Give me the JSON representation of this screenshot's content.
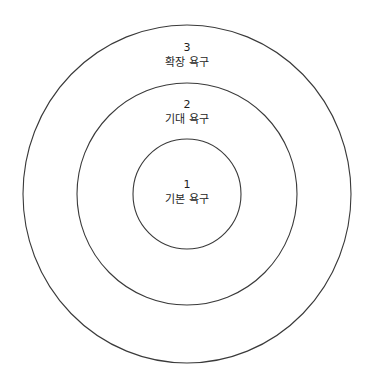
{
  "diagram": {
    "type": "concentric-circles",
    "stroke_color": "#3a3a3a",
    "background": "#ffffff",
    "center": {
      "x": 187,
      "y": 194
    },
    "rings": [
      {
        "level": "1",
        "label": "기본 욕구",
        "rx": 54,
        "ry": 55
      },
      {
        "level": "2",
        "label": "기대 욕구",
        "rx": 110,
        "ry": 111
      },
      {
        "level": "3",
        "label": "확장 욕구",
        "rx": 164,
        "ry": 169
      }
    ]
  }
}
